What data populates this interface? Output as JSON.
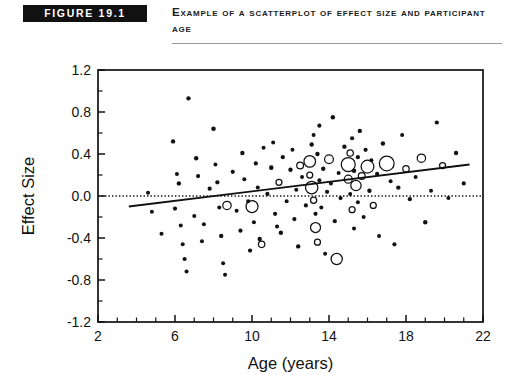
{
  "header": {
    "badge_label": "FIGURE 19.1",
    "title": "Example of a Scatterplot of Effect Size and Participant Age",
    "badge_bg": "#111111",
    "badge_fg": "#ffffff",
    "rule_color": "#9a9a9a"
  },
  "chart_data": {
    "type": "scatter",
    "title": "Example of a Scatterplot of Effect Size and Participant Age",
    "xlabel": "Age (years)",
    "ylabel": "Effect Size",
    "xlim": [
      2,
      22
    ],
    "ylim": [
      -1.2,
      1.2
    ],
    "xticks": [
      2,
      6,
      10,
      14,
      18,
      22
    ],
    "xtick_labels": [
      "2",
      "6",
      "10",
      "14",
      "18",
      "22"
    ],
    "xminor_step": 1,
    "yticks": [
      -1.2,
      -0.8,
      -0.4,
      0.0,
      0.4,
      0.8,
      1.2
    ],
    "ytick_labels": [
      "-1.2",
      "-0.8",
      "-0.4",
      "0.0",
      "0.4",
      "0.8",
      "1.2"
    ],
    "yminor_step": 0.2,
    "grid": false,
    "legend": null,
    "marker_encoding": "bubble size proportional to study weight / sample size",
    "reference_lines": [
      {
        "name": "zero-effect-line",
        "type": "horizontal",
        "y": 0.0,
        "style": "dotted"
      }
    ],
    "trend_line": {
      "name": "regression-line",
      "type": "linear",
      "x_start": 3.6,
      "y_start": -0.1,
      "x_end": 21.3,
      "y_end": 0.3
    },
    "points": [
      {
        "x": 4.6,
        "y": 0.03,
        "r": 2.0,
        "filled": true
      },
      {
        "x": 4.8,
        "y": -0.15,
        "r": 2.0,
        "filled": true
      },
      {
        "x": 5.3,
        "y": -0.36,
        "r": 2.0,
        "filled": true
      },
      {
        "x": 5.9,
        "y": 0.52,
        "r": 2.2,
        "filled": true
      },
      {
        "x": 6.0,
        "y": -0.12,
        "r": 2.1,
        "filled": true
      },
      {
        "x": 6.1,
        "y": 0.21,
        "r": 2.0,
        "filled": true
      },
      {
        "x": 6.2,
        "y": 0.12,
        "r": 2.2,
        "filled": true
      },
      {
        "x": 6.3,
        "y": -0.28,
        "r": 2.0,
        "filled": true
      },
      {
        "x": 6.4,
        "y": -0.46,
        "r": 2.0,
        "filled": true
      },
      {
        "x": 6.5,
        "y": -0.6,
        "r": 2.1,
        "filled": true
      },
      {
        "x": 6.6,
        "y": -0.72,
        "r": 2.0,
        "filled": true
      },
      {
        "x": 6.7,
        "y": 0.93,
        "r": 2.2,
        "filled": true
      },
      {
        "x": 7.0,
        "y": -0.19,
        "r": 2.0,
        "filled": true
      },
      {
        "x": 7.1,
        "y": 0.36,
        "r": 2.2,
        "filled": true
      },
      {
        "x": 7.2,
        "y": 0.19,
        "r": 2.1,
        "filled": true
      },
      {
        "x": 7.4,
        "y": -0.43,
        "r": 2.0,
        "filled": true
      },
      {
        "x": 7.5,
        "y": -0.27,
        "r": 2.0,
        "filled": true
      },
      {
        "x": 7.8,
        "y": 0.07,
        "r": 2.1,
        "filled": true
      },
      {
        "x": 8.0,
        "y": 0.64,
        "r": 2.3,
        "filled": true
      },
      {
        "x": 8.1,
        "y": 0.3,
        "r": 2.0,
        "filled": true
      },
      {
        "x": 8.2,
        "y": 0.13,
        "r": 2.1,
        "filled": true
      },
      {
        "x": 8.3,
        "y": -0.11,
        "r": 2.0,
        "filled": true
      },
      {
        "x": 8.4,
        "y": -0.38,
        "r": 2.2,
        "filled": true
      },
      {
        "x": 8.5,
        "y": -0.64,
        "r": 2.0,
        "filled": true
      },
      {
        "x": 8.6,
        "y": -0.75,
        "r": 2.0,
        "filled": true
      },
      {
        "x": 8.7,
        "y": -0.09,
        "r": 4.2,
        "filled": false
      },
      {
        "x": 9.0,
        "y": 0.23,
        "r": 2.1,
        "filled": true
      },
      {
        "x": 9.2,
        "y": -0.14,
        "r": 2.0,
        "filled": true
      },
      {
        "x": 9.4,
        "y": -0.33,
        "r": 2.1,
        "filled": true
      },
      {
        "x": 9.5,
        "y": 0.41,
        "r": 2.2,
        "filled": true
      },
      {
        "x": 9.6,
        "y": 0.16,
        "r": 2.0,
        "filled": true
      },
      {
        "x": 9.8,
        "y": -0.05,
        "r": 2.0,
        "filled": true
      },
      {
        "x": 9.9,
        "y": -0.52,
        "r": 2.1,
        "filled": true
      },
      {
        "x": 10.0,
        "y": -0.1,
        "r": 6.0,
        "filled": false
      },
      {
        "x": 10.1,
        "y": -0.25,
        "r": 2.0,
        "filled": true
      },
      {
        "x": 10.2,
        "y": 0.31,
        "r": 2.1,
        "filled": true
      },
      {
        "x": 10.3,
        "y": 0.08,
        "r": 2.0,
        "filled": true
      },
      {
        "x": 10.4,
        "y": -0.41,
        "r": 2.2,
        "filled": true
      },
      {
        "x": 10.5,
        "y": -0.46,
        "r": 3.2,
        "filled": false
      },
      {
        "x": 10.6,
        "y": 0.46,
        "r": 2.0,
        "filled": true
      },
      {
        "x": 10.8,
        "y": 0.02,
        "r": 2.1,
        "filled": true
      },
      {
        "x": 11.0,
        "y": 0.27,
        "r": 2.3,
        "filled": true
      },
      {
        "x": 11.1,
        "y": 0.51,
        "r": 2.0,
        "filled": true
      },
      {
        "x": 11.2,
        "y": -0.17,
        "r": 2.1,
        "filled": true
      },
      {
        "x": 11.3,
        "y": -0.29,
        "r": 2.0,
        "filled": true
      },
      {
        "x": 11.4,
        "y": 0.13,
        "r": 3.0,
        "filled": false
      },
      {
        "x": 11.5,
        "y": -0.35,
        "r": 2.2,
        "filled": true
      },
      {
        "x": 11.6,
        "y": 0.37,
        "r": 2.1,
        "filled": true
      },
      {
        "x": 11.8,
        "y": -0.05,
        "r": 2.0,
        "filled": true
      },
      {
        "x": 12.0,
        "y": 0.25,
        "r": 2.2,
        "filled": true
      },
      {
        "x": 12.1,
        "y": 0.44,
        "r": 2.0,
        "filled": true
      },
      {
        "x": 12.2,
        "y": -0.22,
        "r": 2.1,
        "filled": true
      },
      {
        "x": 12.3,
        "y": 0.06,
        "r": 2.0,
        "filled": true
      },
      {
        "x": 12.4,
        "y": -0.48,
        "r": 2.2,
        "filled": true
      },
      {
        "x": 12.5,
        "y": 0.29,
        "r": 3.4,
        "filled": false
      },
      {
        "x": 12.6,
        "y": 0.18,
        "r": 2.0,
        "filled": true
      },
      {
        "x": 12.8,
        "y": -0.09,
        "r": 2.1,
        "filled": true
      },
      {
        "x": 13.0,
        "y": 0.33,
        "r": 5.8,
        "filled": false
      },
      {
        "x": 13.0,
        "y": 0.2,
        "r": 3.0,
        "filled": false
      },
      {
        "x": 13.1,
        "y": 0.49,
        "r": 2.2,
        "filled": true
      },
      {
        "x": 13.1,
        "y": 0.08,
        "r": 6.2,
        "filled": false
      },
      {
        "x": 13.2,
        "y": -0.04,
        "r": 3.1,
        "filled": false
      },
      {
        "x": 13.2,
        "y": 0.58,
        "r": 2.0,
        "filled": true
      },
      {
        "x": 13.3,
        "y": -0.17,
        "r": 2.1,
        "filled": true
      },
      {
        "x": 13.3,
        "y": -0.3,
        "r": 5.0,
        "filled": false
      },
      {
        "x": 13.4,
        "y": 0.4,
        "r": 2.2,
        "filled": true
      },
      {
        "x": 13.4,
        "y": -0.44,
        "r": 3.0,
        "filled": false
      },
      {
        "x": 13.5,
        "y": 0.15,
        "r": 2.0,
        "filled": true
      },
      {
        "x": 13.5,
        "y": 0.67,
        "r": 2.1,
        "filled": true
      },
      {
        "x": 13.6,
        "y": -0.11,
        "r": 2.0,
        "filled": true
      },
      {
        "x": 13.7,
        "y": 0.26,
        "r": 2.2,
        "filled": true
      },
      {
        "x": 13.8,
        "y": -0.55,
        "r": 2.0,
        "filled": true
      },
      {
        "x": 13.9,
        "y": 0.04,
        "r": 2.1,
        "filled": true
      },
      {
        "x": 14.0,
        "y": 0.35,
        "r": 4.4,
        "filled": false
      },
      {
        "x": 14.1,
        "y": 0.12,
        "r": 2.0,
        "filled": true
      },
      {
        "x": 14.2,
        "y": 0.75,
        "r": 2.2,
        "filled": true
      },
      {
        "x": 14.3,
        "y": -0.24,
        "r": 2.1,
        "filled": true
      },
      {
        "x": 14.4,
        "y": -0.6,
        "r": 5.6,
        "filled": false
      },
      {
        "x": 14.5,
        "y": 0.22,
        "r": 2.0,
        "filled": true
      },
      {
        "x": 14.6,
        "y": -0.02,
        "r": 2.1,
        "filled": true
      },
      {
        "x": 14.8,
        "y": 0.47,
        "r": 2.2,
        "filled": true
      },
      {
        "x": 15.0,
        "y": 0.3,
        "r": 7.0,
        "filled": false
      },
      {
        "x": 15.0,
        "y": 0.16,
        "r": 4.0,
        "filled": false
      },
      {
        "x": 15.1,
        "y": 0.41,
        "r": 3.2,
        "filled": false
      },
      {
        "x": 15.1,
        "y": 0.02,
        "r": 2.0,
        "filled": true
      },
      {
        "x": 15.2,
        "y": 0.55,
        "r": 2.1,
        "filled": true
      },
      {
        "x": 15.2,
        "y": -0.13,
        "r": 3.0,
        "filled": false
      },
      {
        "x": 15.3,
        "y": 0.24,
        "r": 2.2,
        "filled": true
      },
      {
        "x": 15.3,
        "y": -0.31,
        "r": 2.0,
        "filled": true
      },
      {
        "x": 15.4,
        "y": 0.1,
        "r": 5.2,
        "filled": false
      },
      {
        "x": 15.5,
        "y": 0.37,
        "r": 2.1,
        "filled": true
      },
      {
        "x": 15.5,
        "y": -0.06,
        "r": 2.0,
        "filled": true
      },
      {
        "x": 15.6,
        "y": 0.62,
        "r": 2.2,
        "filled": true
      },
      {
        "x": 15.7,
        "y": 0.19,
        "r": 3.4,
        "filled": false
      },
      {
        "x": 15.8,
        "y": -0.2,
        "r": 2.0,
        "filled": true
      },
      {
        "x": 15.9,
        "y": 0.44,
        "r": 2.1,
        "filled": true
      },
      {
        "x": 16.0,
        "y": 0.28,
        "r": 6.4,
        "filled": false
      },
      {
        "x": 16.1,
        "y": 0.05,
        "r": 2.2,
        "filled": true
      },
      {
        "x": 16.2,
        "y": 0.34,
        "r": 2.0,
        "filled": true
      },
      {
        "x": 16.3,
        "y": -0.09,
        "r": 3.0,
        "filled": false
      },
      {
        "x": 16.5,
        "y": 0.21,
        "r": 2.1,
        "filled": true
      },
      {
        "x": 16.6,
        "y": -0.38,
        "r": 2.0,
        "filled": true
      },
      {
        "x": 16.8,
        "y": 0.5,
        "r": 2.2,
        "filled": true
      },
      {
        "x": 17.0,
        "y": 0.31,
        "r": 7.4,
        "filled": false
      },
      {
        "x": 17.2,
        "y": 0.14,
        "r": 2.0,
        "filled": true
      },
      {
        "x": 17.4,
        "y": -0.46,
        "r": 2.1,
        "filled": true
      },
      {
        "x": 17.6,
        "y": 0.08,
        "r": 2.2,
        "filled": true
      },
      {
        "x": 17.8,
        "y": 0.58,
        "r": 2.0,
        "filled": true
      },
      {
        "x": 18.0,
        "y": 0.26,
        "r": 3.2,
        "filled": false
      },
      {
        "x": 18.2,
        "y": -0.03,
        "r": 2.1,
        "filled": true
      },
      {
        "x": 18.5,
        "y": 0.18,
        "r": 2.0,
        "filled": true
      },
      {
        "x": 18.8,
        "y": 0.36,
        "r": 4.2,
        "filled": false
      },
      {
        "x": 19.0,
        "y": -0.25,
        "r": 2.2,
        "filled": true
      },
      {
        "x": 19.3,
        "y": 0.05,
        "r": 2.0,
        "filled": true
      },
      {
        "x": 19.6,
        "y": 0.7,
        "r": 2.1,
        "filled": true
      },
      {
        "x": 19.9,
        "y": 0.29,
        "r": 3.0,
        "filled": false
      },
      {
        "x": 20.2,
        "y": -0.02,
        "r": 2.0,
        "filled": true
      },
      {
        "x": 20.6,
        "y": 0.41,
        "r": 2.2,
        "filled": true
      },
      {
        "x": 21.0,
        "y": 0.12,
        "r": 2.1,
        "filled": true
      }
    ]
  }
}
